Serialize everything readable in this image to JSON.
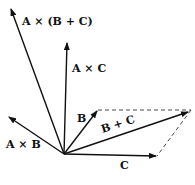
{
  "diagram": {
    "type": "vector-diagram",
    "origin": [
      64,
      154
    ],
    "vectors": [
      {
        "id": "a-cross-b-plus-c",
        "label": "A × (B + C)",
        "tip": [
          10,
          8
        ]
      },
      {
        "id": "a-cross-c",
        "label": "A × C",
        "tip": [
          67,
          43
        ]
      },
      {
        "id": "b",
        "label": "B",
        "tip": [
          98,
          110
        ]
      },
      {
        "id": "b-plus-c",
        "label": "B + C",
        "tip": [
          189,
          112
        ]
      },
      {
        "id": "c",
        "label": "C",
        "tip": [
          157,
          156
        ]
      },
      {
        "id": "a-cross-b",
        "label": "A × B",
        "tip": [
          8,
          117
        ]
      }
    ],
    "dashed_lines": [
      {
        "from": [
          98,
          110
        ],
        "to": [
          191,
          110
        ]
      },
      {
        "from": [
          191,
          110
        ],
        "to": [
          157,
          156
        ]
      }
    ],
    "stroke_color": "#111111"
  },
  "labels": {
    "a_cross_b_plus_c": "A × (B + C)",
    "a_cross_c": "A × C",
    "b": "B",
    "b_plus_c": "B + C",
    "c": "C",
    "a_cross_b": "A × B"
  }
}
